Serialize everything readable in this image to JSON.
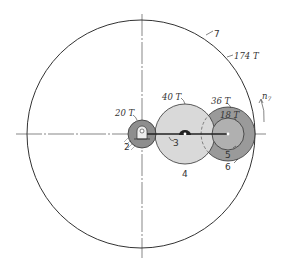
{
  "diagram": {
    "colors": {
      "line": "#333333",
      "gear2_fill": "#8e8e8e",
      "gear4_fill": "#d9d9d9",
      "gear6_fill": "#9a9a9a",
      "gear5_fill": "#b0b0b0",
      "background": "#ffffff"
    },
    "gears": [
      {
        "id": "2",
        "teeth_label": "20 T",
        "label": "2"
      },
      {
        "id": "3",
        "label": "3",
        "description": "arm"
      },
      {
        "id": "4",
        "teeth_label": "40 T",
        "label": "4"
      },
      {
        "id": "5",
        "teeth_label": "18 T",
        "label": "5"
      },
      {
        "id": "6",
        "teeth_label": "36 T",
        "label": "6"
      },
      {
        "id": "7",
        "teeth_label": "174 T",
        "label": "7"
      }
    ],
    "annotations": {
      "rotation_label": "n",
      "rotation_subscript": "7"
    }
  }
}
